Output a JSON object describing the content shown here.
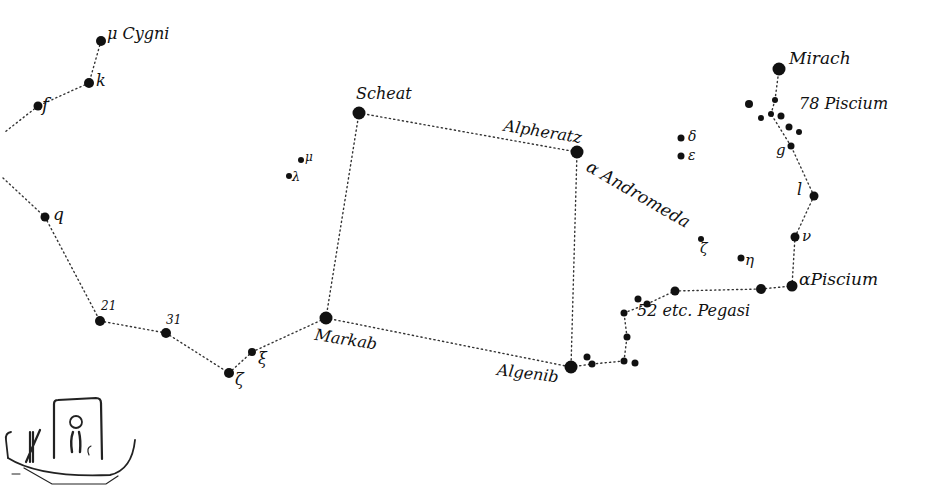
{
  "colors": {
    "ink": "#111111",
    "line": "#333333",
    "background": "#ffffff"
  },
  "stars": [
    {
      "id": "mu_cyg",
      "x": 101,
      "y": 41,
      "r": 5
    },
    {
      "id": "k",
      "x": 89,
      "y": 83,
      "r": 5
    },
    {
      "id": "f",
      "x": 38,
      "y": 106,
      "r": 4.5
    },
    {
      "id": "q",
      "x": 45,
      "y": 217,
      "r": 4.5
    },
    {
      "id": "s21",
      "x": 100,
      "y": 321,
      "r": 5
    },
    {
      "id": "s31",
      "x": 166,
      "y": 333,
      "r": 5
    },
    {
      "id": "zeta",
      "x": 229,
      "y": 373,
      "r": 5
    },
    {
      "id": "xi",
      "x": 252,
      "y": 352,
      "r": 4
    },
    {
      "id": "markab",
      "x": 326,
      "y": 318,
      "r": 6.5
    },
    {
      "id": "scheat",
      "x": 359,
      "y": 113,
      "r": 6.5
    },
    {
      "id": "alpheratz",
      "x": 577,
      "y": 152,
      "r": 6.5
    },
    {
      "id": "algenib",
      "x": 571,
      "y": 367,
      "r": 6.5
    },
    {
      "id": "lambda",
      "x": 289,
      "y": 176,
      "r": 3
    },
    {
      "id": "mu_peg",
      "x": 301,
      "y": 160,
      "r": 3
    },
    {
      "id": "delta",
      "x": 681,
      "y": 138,
      "r": 3.5
    },
    {
      "id": "epsilon",
      "x": 681,
      "y": 156,
      "r": 3.5
    },
    {
      "id": "zeta_and",
      "x": 701,
      "y": 239,
      "r": 3
    },
    {
      "id": "eta",
      "x": 741,
      "y": 258,
      "r": 3.5
    },
    {
      "id": "p1",
      "x": 587,
      "y": 357,
      "r": 3.5
    },
    {
      "id": "p2",
      "x": 592,
      "y": 364,
      "r": 3.5
    },
    {
      "id": "p3",
      "x": 624,
      "y": 361,
      "r": 3.5
    },
    {
      "id": "p4",
      "x": 635,
      "y": 363,
      "r": 3.5
    },
    {
      "id": "p5",
      "x": 627,
      "y": 337,
      "r": 3.5
    },
    {
      "id": "p6",
      "x": 624,
      "y": 313,
      "r": 3.5
    },
    {
      "id": "p7",
      "x": 638,
      "y": 299,
      "r": 3.5
    },
    {
      "id": "p8",
      "x": 647,
      "y": 304,
      "r": 3.5
    },
    {
      "id": "p9",
      "x": 675,
      "y": 291,
      "r": 4.5
    },
    {
      "id": "p10",
      "x": 761,
      "y": 289,
      "r": 5
    },
    {
      "id": "alpha_psc",
      "x": 792,
      "y": 286,
      "r": 5.5
    },
    {
      "id": "nu",
      "x": 795,
      "y": 237,
      "r": 4.5
    },
    {
      "id": "l",
      "x": 814,
      "y": 196,
      "r": 4.5
    },
    {
      "id": "g",
      "x": 791,
      "y": 146,
      "r": 3.5
    },
    {
      "id": "mirach",
      "x": 779,
      "y": 69,
      "r": 6.5
    },
    {
      "id": "c1",
      "x": 749,
      "y": 104,
      "r": 4
    },
    {
      "id": "c2",
      "x": 775,
      "y": 100,
      "r": 3
    },
    {
      "id": "c3",
      "x": 761,
      "y": 118,
      "r": 3
    },
    {
      "id": "c4",
      "x": 771,
      "y": 114,
      "r": 3
    },
    {
      "id": "c5",
      "x": 781,
      "y": 116,
      "r": 3.5
    },
    {
      "id": "c6",
      "x": 789,
      "y": 127,
      "r": 3.5
    },
    {
      "id": "c7",
      "x": 799,
      "y": 132,
      "r": 3
    }
  ],
  "lines": [
    [
      "mu_cyg",
      "k"
    ],
    [
      "k",
      "f"
    ],
    [
      "f",
      "edge_top"
    ],
    [
      "edge_bot",
      "q"
    ],
    [
      "q",
      "s21"
    ],
    [
      "s21",
      "s31"
    ],
    [
      "s31",
      "zeta"
    ],
    [
      "zeta",
      "xi"
    ],
    [
      "xi",
      "markab"
    ],
    [
      "markab",
      "scheat"
    ],
    [
      "scheat",
      "alpheratz"
    ],
    [
      "alpheratz",
      "algenib"
    ],
    [
      "markab",
      "algenib"
    ],
    [
      "algenib",
      "p2"
    ],
    [
      "p2",
      "p3"
    ],
    [
      "p3",
      "p5"
    ],
    [
      "p5",
      "p6"
    ],
    [
      "p6",
      "p8"
    ],
    [
      "p8",
      "p9"
    ],
    [
      "p9",
      "p10"
    ],
    [
      "p10",
      "alpha_psc"
    ],
    [
      "alpha_psc",
      "nu"
    ],
    [
      "nu",
      "l"
    ],
    [
      "l",
      "g"
    ],
    [
      "g",
      "c4"
    ],
    [
      "c4",
      "c2"
    ],
    [
      "c2",
      "mirach"
    ]
  ],
  "edge_points": {
    "edge_top": {
      "x": 5,
      "y": 132
    },
    "edge_bot": {
      "x": 3,
      "y": 178
    }
  },
  "labels": [
    {
      "id": "mu-cygni",
      "text": "μ Cygni",
      "x": 107,
      "y": 26,
      "size": 16,
      "rot": 0
    },
    {
      "id": "k",
      "text": "k",
      "x": 96,
      "y": 73,
      "size": 16,
      "rot": 0
    },
    {
      "id": "f",
      "text": "f",
      "x": 42,
      "y": 96,
      "size": 18,
      "rot": 0
    },
    {
      "id": "q",
      "text": "q",
      "x": 53,
      "y": 206,
      "size": 17,
      "rot": 0
    },
    {
      "id": "n21",
      "text": "21",
      "x": 101,
      "y": 300,
      "size": 12,
      "rot": 0
    },
    {
      "id": "n31",
      "text": "31",
      "x": 166,
      "y": 314,
      "size": 12,
      "rot": 0
    },
    {
      "id": "zeta",
      "text": "ζ",
      "x": 235,
      "y": 372,
      "size": 16,
      "rot": 0
    },
    {
      "id": "xi",
      "text": "ξ",
      "x": 258,
      "y": 351,
      "size": 16,
      "rot": 0
    },
    {
      "id": "lambda",
      "text": "λ",
      "x": 292,
      "y": 170,
      "size": 13,
      "rot": 0
    },
    {
      "id": "mu",
      "text": "μ",
      "x": 305,
      "y": 151,
      "size": 12,
      "rot": 0
    },
    {
      "id": "scheat",
      "text": "Scheat",
      "x": 356,
      "y": 86,
      "size": 16,
      "rot": 0
    },
    {
      "id": "alpheratz",
      "text": "Alpheratz",
      "x": 505,
      "y": 118,
      "size": 16,
      "rot": 9
    },
    {
      "id": "alpha-andromeda",
      "text": "α Andromeda",
      "x": 592,
      "y": 158,
      "size": 17,
      "rot": 30
    },
    {
      "id": "delta",
      "text": "δ",
      "x": 688,
      "y": 129,
      "size": 14,
      "rot": 0
    },
    {
      "id": "epsilon",
      "text": "ε",
      "x": 688,
      "y": 148,
      "size": 14,
      "rot": 0
    },
    {
      "id": "zeta-and",
      "text": "ζ",
      "x": 700,
      "y": 241,
      "size": 14,
      "rot": 0
    },
    {
      "id": "eta",
      "text": "η",
      "x": 745,
      "y": 253,
      "size": 15,
      "rot": 0
    },
    {
      "id": "markab",
      "text": "Markab",
      "x": 316,
      "y": 327,
      "size": 16,
      "rot": 9
    },
    {
      "id": "algenib",
      "text": "Algenib",
      "x": 498,
      "y": 362,
      "size": 16,
      "rot": 7
    },
    {
      "id": "pegasi",
      "text": "52 etc. Pegasi",
      "x": 637,
      "y": 303,
      "size": 16,
      "rot": 0
    },
    {
      "id": "alpha-piscium",
      "text": "αPiscium",
      "x": 799,
      "y": 271,
      "size": 17,
      "rot": 0
    },
    {
      "id": "nu",
      "text": "ν",
      "x": 802,
      "y": 229,
      "size": 15,
      "rot": 0
    },
    {
      "id": "l",
      "text": "l",
      "x": 797,
      "y": 182,
      "size": 16,
      "rot": 0
    },
    {
      "id": "g",
      "text": "g",
      "x": 776,
      "y": 143,
      "size": 15,
      "rot": 0
    },
    {
      "id": "piscium78",
      "text": "78 Piscium",
      "x": 799,
      "y": 96,
      "size": 16,
      "rot": 0
    },
    {
      "id": "mirach",
      "text": "Mirach",
      "x": 789,
      "y": 50,
      "size": 17,
      "rot": 0
    }
  ],
  "vignette": {
    "description": "Egyptian barque with shrine and seated figure"
  }
}
